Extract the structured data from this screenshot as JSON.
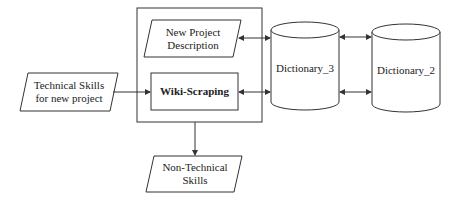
{
  "diagram": {
    "nodes": {
      "technical_skills": {
        "label": "Technical Skills for new project",
        "shape": "parallelogram"
      },
      "new_project_description": {
        "label": "New Project Description",
        "shape": "parallelogram"
      },
      "wiki_scraping": {
        "label": "Wiki-Scraping",
        "shape": "rectangle"
      },
      "dictionary_3": {
        "label": "Dictionary_3",
        "shape": "cylinder"
      },
      "dictionary_2": {
        "label": "Dictionary_2",
        "shape": "cylinder"
      },
      "non_technical_skills": {
        "label": "Non-Technical Skills",
        "shape": "parallelogram"
      }
    },
    "edges": [
      {
        "from": "technical_skills",
        "to": "wiki_scraping",
        "type": "arrow"
      },
      {
        "from": "new_project_description",
        "to": "dictionary_3",
        "type": "bidirectional"
      },
      {
        "from": "wiki_scraping",
        "to": "dictionary_3",
        "type": "bidirectional"
      },
      {
        "from": "dictionary_3",
        "to": "dictionary_2",
        "type": "bidirectional",
        "count": 2
      },
      {
        "from": "process_group",
        "to": "non_technical_skills",
        "type": "arrow"
      }
    ],
    "colors": {
      "stroke": "#333333",
      "background": "#ffffff",
      "text": "#222222"
    }
  }
}
